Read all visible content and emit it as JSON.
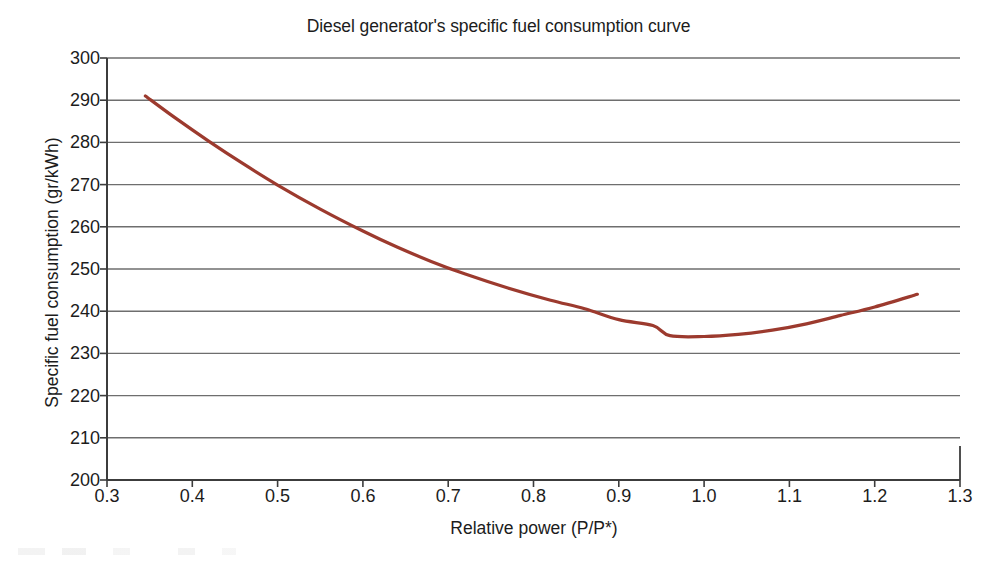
{
  "chart_data": {
    "type": "line",
    "title": "Diesel generator's specific fuel consumption curve",
    "xlabel": "Relative power (P/P*)",
    "ylabel": "Specific fuel consumption (gr/kWh)",
    "xlim": [
      0.3,
      1.3
    ],
    "ylim": [
      200,
      300
    ],
    "xticks": [
      "0.3",
      "0.4",
      "0.5",
      "0.6",
      "0.7",
      "0.8",
      "0.9",
      "1.0",
      "1.1",
      "1.2",
      "1.3"
    ],
    "xtick_values": [
      0.3,
      0.4,
      0.5,
      0.6,
      0.7,
      0.8,
      0.9,
      1.0,
      1.1,
      1.2,
      1.3
    ],
    "yticks": [
      "200",
      "210",
      "220",
      "230",
      "240",
      "250",
      "260",
      "270",
      "280",
      "290",
      "300"
    ],
    "ytick_values": [
      200,
      210,
      220,
      230,
      240,
      250,
      260,
      270,
      280,
      290,
      300
    ],
    "grid": "horizontal",
    "legend": null,
    "line_color": "#9c3a2e",
    "line_width": 3.2,
    "grid_color": "#6e6e6e",
    "axis_color": "#3c3c3c",
    "series": [
      {
        "name": "Specific fuel consumption",
        "x": [
          0.345,
          0.38,
          0.42,
          0.46,
          0.5,
          0.55,
          0.6,
          0.64,
          0.68,
          0.72,
          0.77,
          0.82,
          0.86,
          0.9,
          0.94,
          0.96,
          1.0,
          1.04,
          1.08,
          1.12,
          1.16,
          1.2,
          1.25
        ],
        "y": [
          291.0,
          285.8,
          280.2,
          274.9,
          269.9,
          264.2,
          259.0,
          255.2,
          251.8,
          248.8,
          245.5,
          242.6,
          240.6,
          238.0,
          236.6,
          234.2,
          234.0,
          234.5,
          235.5,
          237.0,
          239.0,
          241.0,
          244.0
        ]
      }
    ]
  },
  "plot_geometry": {
    "left": 107,
    "right": 960,
    "top": 58,
    "bottom": 480
  }
}
